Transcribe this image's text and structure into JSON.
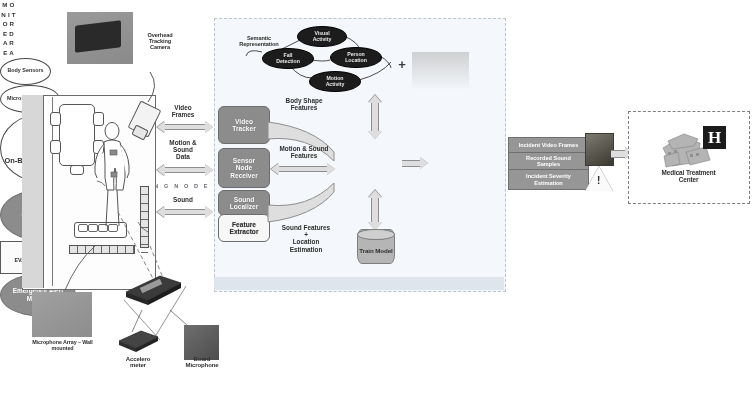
{
  "diagram": {
    "monitored_area": {
      "vertical_label": "M\nO\nN\nI\nT\nO\nR\nE\nD\n\nA\nR\nE\nA",
      "callouts": {
        "body_sensors": "Body\nSensors",
        "microphone_array": "Microphone\nArray"
      },
      "overhead_camera_label": "Overhead\nTracking\nCamera"
    },
    "hardware": {
      "mic_wall": "Microphone Array – Wall\nmounted",
      "on_body_sensor_node": "On-Body\nSensor\nNode",
      "accelerometer": "Accelero\nmeter",
      "board_microphone": "Board\nMicrophone"
    },
    "input_flows": [
      {
        "name": "video-frames",
        "label": "Video\nFrames"
      },
      {
        "name": "motion-sound-data",
        "label": "Motion &\nSound\nData"
      },
      {
        "name": "sound",
        "label": "Sound"
      }
    ],
    "monitoring_node": {
      "footer_label": "M O N I T O R I N G   N O D E",
      "modules": [
        {
          "name": "video-tracker",
          "label": "Video\nTracker"
        },
        {
          "name": "sensor-node-receiver",
          "label": "Sensor\nNode\nReceiver"
        },
        {
          "name": "sound-localizer",
          "label": "Sound\nLocalizer"
        },
        {
          "name": "feature-extractor",
          "label": "Feature\nExtractor"
        }
      ],
      "fusion_module": "Fusion /\nClassification\nModule",
      "train_model": "Train Model",
      "feature_flows": [
        {
          "name": "body-shape-features",
          "label": "Body Shape\nFeatures"
        },
        {
          "name": "motion-sound-features",
          "label": "Motion & Sound\nFeatures"
        },
        {
          "name": "sound-features-location",
          "label": "Sound Features\n+\nLocation\nEstimation"
        }
      ],
      "semantic": {
        "label": "Semantic\nRepresentation",
        "nodes": [
          {
            "name": "visual-activity",
            "label": "Visual\nActivity"
          },
          {
            "name": "fall-detection",
            "label": "Fall\nDetection"
          },
          {
            "name": "person-location",
            "label": "Person\nLocation"
          },
          {
            "name": "motion-activity",
            "label": "Motion\nActivity"
          }
        ]
      },
      "rules_evaluation": "RULES\nEVALUATION",
      "plus": "+"
    },
    "emergency": {
      "alert_module": "Emergency Alert\nModule",
      "outputs": [
        {
          "name": "incident-video-frames",
          "label": "Incident Video Frames"
        },
        {
          "name": "recorded-sound-samples",
          "label": "Recorded Sound\nSamples"
        },
        {
          "name": "incident-severity-estimation",
          "label": "Incident Severity\nEstimation"
        }
      ],
      "warning_glyph": "!"
    },
    "medical": {
      "label": "Medical Treatment\nCenter",
      "hospital_glyph": "H"
    },
    "colors": {
      "panel_bg": "#f4f7fb",
      "module_fill": "#8c8c8c",
      "semantic_fill": "#1c1c1c",
      "arrow_fill": "#dedede",
      "alert_fill": "#969696",
      "footer_bg": "#dfe5ec"
    }
  }
}
